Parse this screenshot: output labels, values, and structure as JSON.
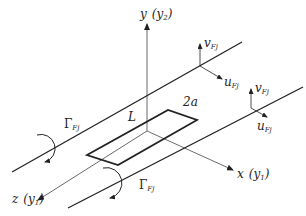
{
  "diagram": {
    "type": "vortex-line-schematic",
    "axes": {
      "y": {
        "main": "y",
        "paren": "(y",
        "sub": "2",
        "close": ")"
      },
      "x": {
        "main": "x",
        "paren": "(y",
        "sub": "1",
        "close": ")"
      },
      "z": {
        "main": "z",
        "paren": "(y",
        "sub": "1",
        "close": ")"
      }
    },
    "plate": {
      "length_label": "L",
      "width_label": "2a"
    },
    "vortices": [
      {
        "id": "upper",
        "circulation": {
          "symbol": "Γ",
          "sub": "Fj"
        },
        "v_label": {
          "main": "v",
          "sub": "Fj"
        },
        "u_label": {
          "main": "u",
          "sub": "Fj"
        }
      },
      {
        "id": "lower",
        "circulation": {
          "symbol": "Γ",
          "sub": "Fj"
        },
        "v_label": {
          "main": "v",
          "sub": "Fj"
        },
        "u_label": {
          "main": "u",
          "sub": "Fj"
        }
      }
    ],
    "colors": {
      "line": "#222222",
      "thin": "#444444",
      "background": "#ffffff"
    }
  }
}
